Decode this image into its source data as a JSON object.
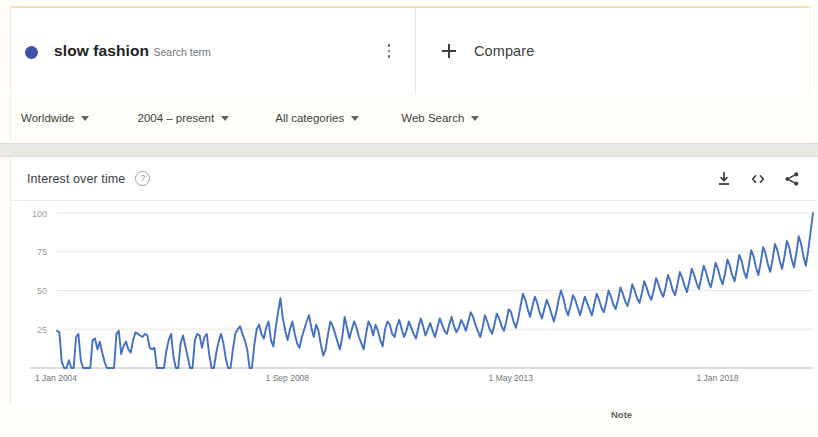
{
  "term": {
    "name": "slow fashion",
    "type_label": "Search term",
    "dot_color": "#4050a8",
    "menu_icon": "kebab-menu-icon"
  },
  "compare": {
    "label": "Compare",
    "icon": "plus-icon"
  },
  "filters": [
    {
      "label": "Worldwide",
      "name": "location"
    },
    {
      "label": "2004 – present",
      "name": "time-range"
    },
    {
      "label": "All categories",
      "name": "category"
    },
    {
      "label": "Web Search",
      "name": "search-type"
    }
  ],
  "card": {
    "title": "Interest over time",
    "help_icon": "help-circle-icon",
    "actions": [
      {
        "name": "download-icon"
      },
      {
        "name": "embed-code-icon"
      },
      {
        "name": "share-icon"
      }
    ]
  },
  "annotation": {
    "note": "Note"
  },
  "chart_data": {
    "type": "line",
    "title": "Interest over time",
    "xlabel": "",
    "ylabel": "",
    "ylim": [
      0,
      100
    ],
    "yticks": [
      25,
      50,
      75,
      100
    ],
    "grid": true,
    "legend": "none",
    "line_color": "#4370c4",
    "x_tick_labels": [
      "1 Jan 2004",
      "1 Sep 2008",
      "1 May 2013",
      "1 Jan 2018"
    ],
    "x_tick_positions": [
      0,
      0.305,
      0.6,
      0.875
    ],
    "series": [
      {
        "name": "slow fashion",
        "values": [
          24,
          23,
          4,
          0,
          0,
          5,
          0,
          0,
          20,
          22,
          5,
          0,
          0,
          0,
          0,
          18,
          19,
          12,
          17,
          10,
          4,
          0,
          0,
          0,
          0,
          22,
          24,
          9,
          14,
          17,
          12,
          10,
          18,
          23,
          22,
          21,
          20,
          22,
          21,
          13,
          12,
          13,
          0,
          0,
          0,
          0,
          11,
          18,
          22,
          7,
          0,
          0,
          16,
          21,
          14,
          7,
          0,
          0,
          18,
          22,
          21,
          13,
          20,
          22,
          9,
          0,
          0,
          10,
          17,
          22,
          16,
          6,
          0,
          0,
          12,
          22,
          25,
          27,
          22,
          18,
          12,
          0,
          0,
          15,
          25,
          28,
          22,
          19,
          26,
          30,
          18,
          14,
          26,
          36,
          45,
          32,
          24,
          18,
          25,
          30,
          22,
          16,
          13,
          20,
          25,
          30,
          34,
          26,
          20,
          28,
          24,
          15,
          8,
          12,
          22,
          30,
          27,
          22,
          17,
          12,
          20,
          33,
          26,
          19,
          25,
          30,
          26,
          20,
          16,
          12,
          22,
          30,
          27,
          21,
          28,
          24,
          18,
          14,
          25,
          30,
          28,
          22,
          20,
          27,
          31,
          25,
          20,
          24,
          30,
          26,
          22,
          19,
          26,
          32,
          27,
          21,
          25,
          29,
          24,
          20,
          26,
          32,
          28,
          24,
          22,
          28,
          33,
          27,
          23,
          26,
          31,
          28,
          24,
          30,
          36,
          33,
          28,
          24,
          20,
          26,
          34,
          30,
          25,
          22,
          28,
          35,
          32,
          27,
          24,
          30,
          38,
          36,
          30,
          26,
          32,
          40,
          48,
          44,
          38,
          33,
          40,
          46,
          42,
          36,
          32,
          38,
          44,
          40,
          35,
          30,
          36,
          44,
          50,
          45,
          38,
          34,
          40,
          47,
          44,
          39,
          34,
          40,
          46,
          42,
          38,
          34,
          41,
          48,
          44,
          39,
          36,
          42,
          50,
          46,
          41,
          38,
          44,
          52,
          48,
          43,
          40,
          46,
          54,
          50,
          45,
          42,
          48,
          56,
          52,
          47,
          44,
          50,
          58,
          54,
          49,
          46,
          52,
          60,
          56,
          50,
          47,
          54,
          62,
          58,
          53,
          49,
          56,
          64,
          60,
          55,
          51,
          58,
          66,
          62,
          56,
          52,
          59,
          68,
          64,
          58,
          54,
          61,
          70,
          66,
          60,
          56,
          64,
          73,
          69,
          62,
          58,
          66,
          76,
          72,
          65,
          60,
          68,
          78,
          74,
          67,
          62,
          70,
          80,
          76,
          69,
          64,
          72,
          82,
          78,
          70,
          65,
          74,
          85,
          80,
          72,
          66,
          76,
          88,
          100
        ]
      }
    ]
  }
}
